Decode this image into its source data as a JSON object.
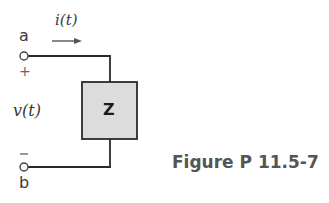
{
  "diagram": {
    "type": "circuit",
    "terminals": {
      "top": {
        "label": "a",
        "polarity": "+"
      },
      "bottom": {
        "label": "b",
        "polarity": "−"
      }
    },
    "current": {
      "label": "i(t)",
      "direction": "right"
    },
    "voltage": {
      "label": "v(t)"
    },
    "element": {
      "label": "Z",
      "fill": "#dcdcdc"
    }
  },
  "caption": "Figure P 11.5-7",
  "colors": {
    "wire": "#2a2a2a",
    "text": "#3a3a3a",
    "caption": "#555555",
    "box_fill": "#dcdcdc"
  }
}
